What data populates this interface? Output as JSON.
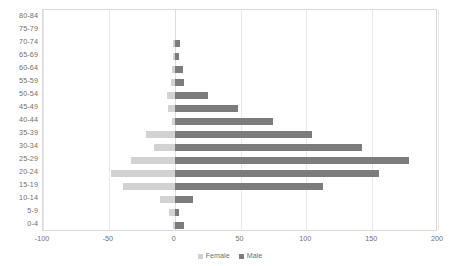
{
  "chart_data": {
    "type": "bar",
    "subtype": "population-pyramid",
    "title": "",
    "xlabel": "",
    "ylabel": "",
    "orientation": "horizontal",
    "grid": true,
    "grid_axis": "x",
    "legend_position": "bottom",
    "xlim": [
      -100,
      200
    ],
    "xticks": [
      -100,
      -50,
      0,
      50,
      100,
      150,
      200
    ],
    "xtick_labels": [
      "-100",
      "-50",
      "0",
      "50",
      "100",
      "150",
      "200"
    ],
    "categories": [
      "80-84",
      "75-79",
      "70-74",
      "65-69",
      "60-64",
      "55-59",
      "50-54",
      "45-49",
      "40-44",
      "35-39",
      "30-34",
      "25-29",
      "20-24",
      "15-19",
      "10-14",
      "5-9",
      "0-4"
    ],
    "series": [
      {
        "name": "Female",
        "color": "#d2d2d2",
        "sign": "negative",
        "values": [
          0,
          0,
          -1,
          -1,
          -2,
          -3,
          -6,
          -5,
          -2,
          -22,
          -16,
          -33,
          -48,
          -39,
          -11,
          -4,
          -1
        ]
      },
      {
        "name": "Male",
        "color": "#7c7c7c",
        "sign": "positive",
        "values": [
          0,
          0,
          4,
          3,
          6,
          7,
          25,
          48,
          75,
          104,
          142,
          178,
          155,
          113,
          14,
          3,
          7
        ]
      }
    ],
    "legend": [
      "Female",
      "Male"
    ]
  },
  "legend": {
    "female_label": "Female",
    "male_label": "Male",
    "female_color": "#d2d2d2",
    "male_color": "#7c7c7c"
  }
}
